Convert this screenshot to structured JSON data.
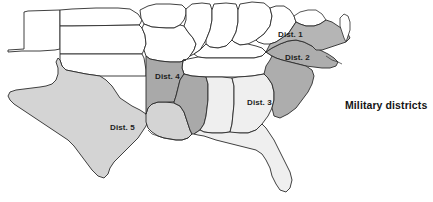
{
  "figure": {
    "width": 433,
    "height": 202,
    "background_color": "#ffffff"
  },
  "caption": {
    "text": "Military districts",
    "color": "#141414",
    "x": 345,
    "y": 99
  },
  "legend_shades": {
    "district_1": "#b5b5b5",
    "district_2": "#adadad",
    "district_3": "#efefef",
    "district_4": "#a9a9a9",
    "district_5": "#d4d4d4",
    "unassigned": "#ffffff",
    "outline": "#2b2b2b"
  },
  "districts": [
    {
      "id": "district-1",
      "label": "Dist. 1",
      "label_x": 278,
      "label_y": 36,
      "fill": "#b5b5b5",
      "states": [
        "Virginia"
      ]
    },
    {
      "id": "district-2",
      "label": "Dist. 2",
      "label_x": 285,
      "label_y": 59,
      "fill": "#adadad",
      "states": [
        "North Carolina",
        "South Carolina"
      ]
    },
    {
      "id": "district-3",
      "label": "Dist. 3",
      "label_x": 247,
      "label_y": 104,
      "fill": "#efefef",
      "states": [
        "Georgia",
        "Alabama",
        "Florida"
      ]
    },
    {
      "id": "district-4",
      "label": "Dist. 4",
      "label_x": 155,
      "label_y": 78,
      "fill": "#a9a9a9",
      "states": [
        "Arkansas",
        "Mississippi"
      ]
    },
    {
      "id": "district-5",
      "label": "Dist. 5",
      "label_x": 110,
      "label_y": 129,
      "fill": "#d4d4d4",
      "states": [
        "Texas",
        "Louisiana"
      ]
    }
  ],
  "unassigned_states": [
    {
      "id": "state-nebraska",
      "name": "Nebraska",
      "fill": "#ffffff"
    },
    {
      "id": "state-kansas",
      "name": "Kansas",
      "fill": "#ffffff"
    },
    {
      "id": "state-colorado",
      "name": "Colorado",
      "fill": "#ffffff"
    },
    {
      "id": "state-missouri",
      "name": "Missouri",
      "fill": "#ffffff"
    },
    {
      "id": "state-iowa",
      "name": "Iowa",
      "fill": "#ffffff"
    },
    {
      "id": "state-illinois",
      "name": "Illinois",
      "fill": "#ffffff"
    },
    {
      "id": "state-indiana",
      "name": "Indiana",
      "fill": "#ffffff"
    },
    {
      "id": "state-ohio",
      "name": "Ohio",
      "fill": "#ffffff"
    },
    {
      "id": "state-kentucky",
      "name": "Kentucky",
      "fill": "#ffffff"
    },
    {
      "id": "state-tennessee",
      "name": "Tennessee",
      "fill": "#ffffff"
    },
    {
      "id": "state-west-virginia",
      "name": "West Virginia",
      "fill": "#ffffff"
    },
    {
      "id": "state-maryland",
      "name": "Maryland",
      "fill": "#ffffff"
    },
    {
      "id": "state-indian-territory",
      "name": "Indian Territory",
      "fill": "#ffffff"
    }
  ]
}
